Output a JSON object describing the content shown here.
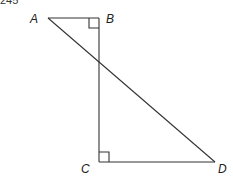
{
  "problem_number": "245",
  "diagram": {
    "points": {
      "A": {
        "label": "A",
        "x": 48,
        "y": 18
      },
      "B": {
        "label": "B",
        "x": 99,
        "y": 18
      },
      "C": {
        "label": "C",
        "x": 99,
        "y": 162
      },
      "D": {
        "label": "D",
        "x": 215,
        "y": 162
      }
    },
    "segments": [
      "AB",
      "BC",
      "CD",
      "AD"
    ],
    "right_angles": [
      "B",
      "C"
    ],
    "line_color": "#333333"
  }
}
